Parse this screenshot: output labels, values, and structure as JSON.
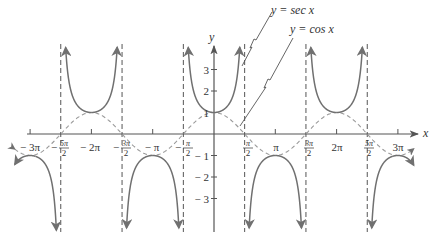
{
  "chart_data": {
    "type": "line",
    "title": "",
    "xlabel": "x",
    "ylabel": "y",
    "xlim": [
      -9.9,
      10.4
    ],
    "ylim": [
      -4.6,
      4.0
    ],
    "grid": false,
    "legend": "annotation labels with leader lines (upper right)",
    "series": [
      {
        "name": "y = sec x",
        "style": "solid",
        "function": "sec(x)",
        "description": "U-shaped branches between vertical asymptotes at odd multiples of pi/2; minima at y=1 for x=-2pi,0,2pi; maxima at y=-1 for x=-3pi,-pi,pi,3pi"
      },
      {
        "name": "y = cos x",
        "style": "dashed",
        "function": "cos(x)",
        "description": "Wave oscillating between -1 and 1, touching sec branches at extrema"
      }
    ],
    "asymptotes": {
      "style": "dashed vertical",
      "x": [
        "-5π/2",
        "-3π/2",
        "-π/2",
        "π/2",
        "3π/2",
        "5π/2"
      ]
    },
    "x_ticks": [
      "-3π",
      "-5π/2",
      "-2π",
      "-3π/2",
      "-π",
      "-π/2",
      "π/2",
      "π",
      "3π/2",
      "2π",
      "5π/2",
      "3π"
    ],
    "y_ticks": [
      "3",
      "2",
      "1",
      "-1",
      "-2",
      "-3"
    ],
    "annotations": [
      "y = sec x",
      "y = cos x"
    ]
  },
  "labels": {
    "x_axis": "x",
    "y_axis": "y",
    "sec_label": "y = sec x",
    "cos_label": "y = cos x",
    "xticks": [
      {
        "text": "− 3π",
        "x": 30,
        "frac": false
      },
      {
        "num": "5π",
        "den": "2",
        "neg": true,
        "x": 59
      },
      {
        "text": "− 2π",
        "x": 90,
        "frac": false
      },
      {
        "num": "3π",
        "den": "2",
        "neg": true,
        "x": 121
      },
      {
        "text": "− π",
        "x": 152,
        "frac": false
      },
      {
        "num": "π",
        "den": "2",
        "neg": true,
        "x": 183
      },
      {
        "num": "π",
        "den": "2",
        "neg": false,
        "x": 245
      },
      {
        "text": "π",
        "x": 276,
        "frac": false
      },
      {
        "num": "3π",
        "den": "2",
        "neg": false,
        "x": 306
      },
      {
        "text": "2π",
        "x": 337,
        "frac": false
      },
      {
        "num": "5π",
        "den": "2",
        "neg": false,
        "x": 366
      },
      {
        "text": "3π",
        "x": 398,
        "frac": false
      }
    ],
    "yticks": [
      "3",
      "2",
      "1",
      "− 1",
      "− 2",
      "− 3"
    ]
  },
  "colors": {
    "curve": "#707070",
    "axis": "#555555",
    "text": "#333333"
  }
}
